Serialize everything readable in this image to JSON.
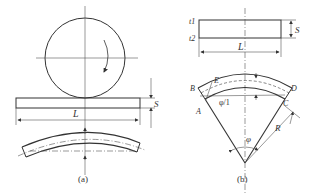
{
  "figure": {
    "panel_a": {
      "caption": "(a)",
      "length_label": "L",
      "thickness_label": "S"
    },
    "panel_b": {
      "caption": "(b)",
      "top_surface_label": "t1",
      "bottom_surface_label": "t2",
      "length_label": "L",
      "thickness_label": "S",
      "points": {
        "E": "E",
        "B": "B",
        "D": "D",
        "A": "A",
        "C": "C"
      },
      "angle_label": "φ",
      "partial_angle_label": "φ/1",
      "radius_label": "R"
    }
  },
  "colors": {
    "line": "#333333",
    "fill_speckle": "#7a7a7a",
    "background": "#ffffff"
  }
}
